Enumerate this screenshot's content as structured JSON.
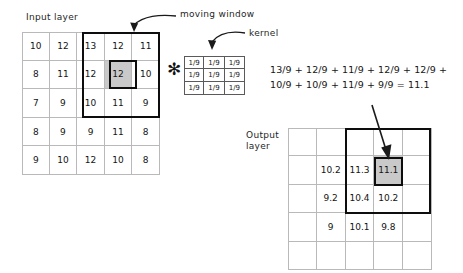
{
  "diagram": {
    "title_labels": {
      "input_layer": "Input layer",
      "output_layer": "Output\nlayer",
      "moving_window": "moving window",
      "kernel": "kernel"
    },
    "operator": "✻",
    "equation": "13/9 + 12/9 + 11/9 + 12/9 + 12/9 +\n10/9 + 10/9 + 11/9 + 9/9 = 11.1",
    "colors": {
      "shaded_cell": "#c9c9c9",
      "grid_line": "#b9b9b9",
      "window_outline": "#0d0d0d",
      "text": "#1a1a1a"
    }
  },
  "input_grid": {
    "rows": 5,
    "cols": 5,
    "values": [
      [
        "10",
        "12",
        "13",
        "12",
        "11"
      ],
      [
        "8",
        "11",
        "12",
        "12",
        "10"
      ],
      [
        "7",
        "9",
        "10",
        "11",
        "9"
      ],
      [
        "8",
        "9",
        "9",
        "11",
        "8"
      ],
      [
        "9",
        "10",
        "12",
        "10",
        "8"
      ]
    ],
    "shaded_cells": [
      [
        1,
        3
      ]
    ],
    "window": {
      "row_start": 0,
      "col_start": 2,
      "rows": 3,
      "cols": 3
    }
  },
  "kernel_grid": {
    "rows": 3,
    "cols": 3,
    "values": [
      [
        "1/9",
        "1/9",
        "1/9"
      ],
      [
        "1/9",
        "1/9",
        "1/9"
      ],
      [
        "1/9",
        "1/9",
        "1/9"
      ]
    ]
  },
  "output_grid": {
    "rows": 5,
    "cols": 5,
    "values": [
      [
        "",
        "",
        "",
        "",
        ""
      ],
      [
        "",
        "10.2",
        "11.3",
        "11.1",
        ""
      ],
      [
        "",
        "9.2",
        "10.4",
        "10.2",
        ""
      ],
      [
        "",
        "9",
        "10.1",
        "9.8",
        ""
      ],
      [
        "",
        "",
        "",
        "",
        ""
      ]
    ],
    "shaded_cells": [
      [
        1,
        3
      ]
    ],
    "window": {
      "row_start": 0,
      "col_start": 2,
      "rows": 3,
      "cols": 3
    }
  }
}
